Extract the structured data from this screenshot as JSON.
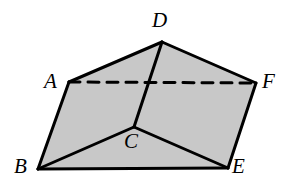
{
  "figure": {
    "background_color": "#ffffff",
    "face_fill_color": "#c8c8c8",
    "edge_color": "#000000",
    "label_color": "#000000",
    "edge_width": 3,
    "hidden_edge_width": 3,
    "hidden_edge_dash": "11 8",
    "canvas": {
      "width": 286,
      "height": 192
    }
  },
  "vertices": [
    {
      "name": "A",
      "label": "A",
      "x": 69,
      "y": 82,
      "label_x": 44,
      "label_y": 71,
      "hidden": false
    },
    {
      "name": "B",
      "label": "B",
      "x": 38,
      "y": 169,
      "label_x": 14,
      "label_y": 156,
      "hidden": false
    },
    {
      "name": "C",
      "label": "C",
      "x": 134,
      "y": 127,
      "label_x": 124,
      "label_y": 131,
      "hidden": false
    },
    {
      "name": "D",
      "label": "D",
      "x": 162,
      "y": 42,
      "label_x": 152,
      "label_y": 10,
      "hidden": false
    },
    {
      "name": "E",
      "label": "E",
      "x": 228,
      "y": 168,
      "label_x": 232,
      "label_y": 156,
      "hidden": false
    },
    {
      "name": "F",
      "label": "F",
      "x": 256,
      "y": 83,
      "label_x": 262,
      "label_y": 71,
      "hidden": false
    }
  ],
  "faces": [
    {
      "name": "face-ABCD-left",
      "points": "69,82 162,42 134,127 38,169",
      "fill": "#c8c8c8"
    },
    {
      "name": "face-DCEF-right",
      "points": "162,42 256,83 228,168 134,127",
      "fill": "#c8c8c8"
    },
    {
      "name": "face-BCE-bottom-front",
      "points": "38,169 134,127 228,168",
      "fill": "#c8c8c8"
    }
  ],
  "edges": [
    {
      "name": "edge-AD",
      "from": "A",
      "to": "D",
      "style": "solid"
    },
    {
      "name": "edge-DF",
      "from": "D",
      "to": "F",
      "style": "solid"
    },
    {
      "name": "edge-AB",
      "from": "A",
      "to": "B",
      "style": "solid"
    },
    {
      "name": "edge-FE",
      "from": "F",
      "to": "E",
      "style": "solid"
    },
    {
      "name": "edge-BE",
      "from": "B",
      "to": "E",
      "style": "solid"
    },
    {
      "name": "edge-DC",
      "from": "D",
      "to": "C",
      "style": "solid"
    },
    {
      "name": "edge-BC",
      "from": "B",
      "to": "C",
      "style": "solid"
    },
    {
      "name": "edge-CE",
      "from": "C",
      "to": "E",
      "style": "solid"
    },
    {
      "name": "edge-AF",
      "from": "A",
      "to": "F",
      "style": "dashed"
    }
  ]
}
